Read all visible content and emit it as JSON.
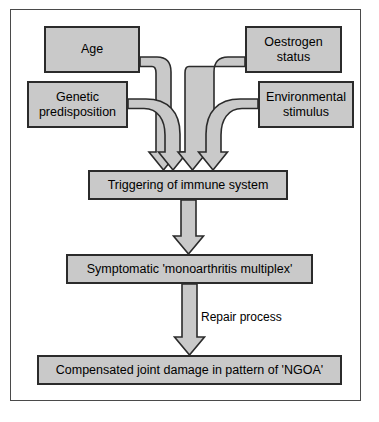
{
  "figure": {
    "type": "flowchart",
    "orientation": "top-to-bottom",
    "background_color": "#ffffff",
    "frame_color": "#4a4a4a",
    "node_fill_color": "#c9c9c9",
    "node_border_color": "#2b2b2b",
    "connector_fill_color": "#c9c9c9",
    "connector_border_color": "#2b2b2b",
    "text_color": "#000000"
  },
  "nodes": [
    {
      "id": "age",
      "label": "Age",
      "tier": "input",
      "lines": [
        "Age"
      ]
    },
    {
      "id": "oestrogen",
      "label": "Oestrogen status",
      "tier": "input",
      "lines": [
        "Oestrogen",
        "status"
      ]
    },
    {
      "id": "genetic",
      "label": "Genetic predisposition",
      "tier": "input",
      "lines": [
        "Genetic",
        "predisposition"
      ]
    },
    {
      "id": "environmental",
      "label": "Environmental stimulus",
      "tier": "input",
      "lines": [
        "Environmental",
        "stimulus"
      ]
    },
    {
      "id": "trigger",
      "label": "Triggering of immune system",
      "tier": "process",
      "lines": [
        "Triggering of immune system"
      ]
    },
    {
      "id": "symptomatic",
      "label": "Symptomatic 'monoarthritis multiplex'",
      "tier": "process",
      "lines": [
        "Symptomatic 'monoarthritis multiplex'"
      ]
    },
    {
      "id": "compensated",
      "label": "Compensated joint damage in pattern of 'NGOA'",
      "tier": "outcome",
      "lines": [
        "Compensated joint damage in pattern of 'NGOA'"
      ]
    }
  ],
  "edges": [
    {
      "id": "edge-age-trigger",
      "from": "age",
      "to": "trigger",
      "label": ""
    },
    {
      "id": "edge-genetic-trigger",
      "from": "genetic",
      "to": "trigger",
      "label": ""
    },
    {
      "id": "edge-oestrogen-trigger",
      "from": "oestrogen",
      "to": "trigger",
      "label": ""
    },
    {
      "id": "edge-environmental-trigger",
      "from": "environmental",
      "to": "trigger",
      "label": ""
    },
    {
      "id": "edge-trigger-symptomatic",
      "from": "trigger",
      "to": "symptomatic",
      "label": ""
    },
    {
      "id": "edge-symptomatic-compensated",
      "from": "symptomatic",
      "to": "compensated",
      "label": "Repair process"
    }
  ],
  "labels": {
    "repair_process": "Repair process"
  }
}
